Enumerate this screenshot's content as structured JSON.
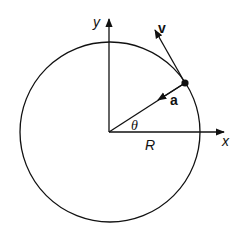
{
  "diagram": {
    "type": "circular-motion",
    "labels": {
      "y_axis": "y",
      "x_axis": "x",
      "velocity": "v",
      "acceleration": "a",
      "angle": "θ",
      "radius": "R"
    },
    "colors": {
      "stroke": "#111111",
      "background": "#ffffff"
    }
  }
}
